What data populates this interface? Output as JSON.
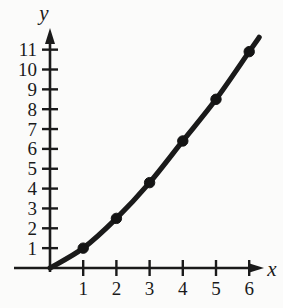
{
  "chart_data": {
    "type": "line",
    "title": "",
    "subtitle": "",
    "xlabel": "x",
    "ylabel": "y",
    "xlim": [
      0,
      6.6
    ],
    "ylim": [
      0,
      11.6
    ],
    "grid": false,
    "legend": null,
    "x": [
      1,
      2,
      3,
      4,
      5,
      6
    ],
    "values": [
      1.0,
      2.5,
      4.3,
      6.4,
      8.5,
      10.9
    ],
    "series": [
      {
        "name": "curve",
        "x": [
          1,
          2,
          3,
          4,
          5,
          6
        ],
        "values": [
          1.0,
          2.5,
          4.3,
          6.4,
          8.5,
          10.9
        ]
      }
    ],
    "x_tick_labels": [
      "1",
      "2",
      "3",
      "4",
      "5",
      "6"
    ],
    "y_tick_labels": [
      "1",
      "2",
      "3",
      "4",
      "5",
      "6",
      "7",
      "8",
      "9",
      "10",
      "11"
    ],
    "x_ticks": [
      1,
      2,
      3,
      4,
      5,
      6
    ],
    "y_ticks": [
      1,
      2,
      3,
      4,
      5,
      6,
      7,
      8,
      9,
      10,
      11
    ],
    "marker": "filled-circle",
    "origin_label": "",
    "annotations": [],
    "colors": {
      "curve": "#1a1a1a",
      "marker": "#141414",
      "axis": "#1a1a1a",
      "background": "#fbfbfa",
      "text": "#1a1a1a"
    },
    "curve_extends_past_last_point": true
  },
  "axes": {
    "x_axis_name": "x",
    "y_axis_name": "y"
  }
}
